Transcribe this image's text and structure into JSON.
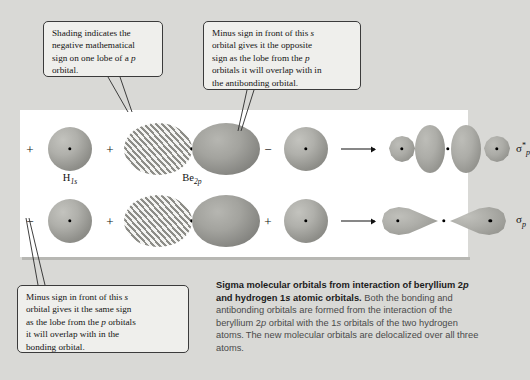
{
  "figure": {
    "background_color": "#d9d9d6",
    "panel_color": "#ffffff"
  },
  "callouts": [
    {
      "id": "shading",
      "name": "callout-shading",
      "text": "Shading indicates the negative mathematical sign on one lobe of a p orbital.",
      "lines": [
        "Shading indicates the",
        "negative mathematical",
        "sign on one lobe of a p",
        "orbital."
      ]
    },
    {
      "id": "antibonding",
      "name": "callout-antibonding",
      "text": "Minus sign in front of this s orbital gives it the opposite sign as the lobe from the p orbitals it will overlap with in the antibonding orbital.",
      "lines": [
        "Minus sign in front of this s",
        "orbital gives it the opposite",
        "sign as the lobe from the p",
        "orbitals it will overlap with in",
        "the antibonding orbital."
      ]
    },
    {
      "id": "bonding",
      "name": "callout-bonding",
      "text": "Minus sign in front of this s orbital gives it the same sign as the lobe from the p orbitals it will overlap with in the bonding orbital.",
      "lines": [
        "Minus sign in front of this s",
        "orbital gives it the same sign",
        "as the lobe from the p orbitals",
        "it will overlap with in the",
        "bonding orbital."
      ]
    }
  ],
  "diagram": {
    "rows": [
      {
        "id": "antibonding",
        "name": "antibonding-row",
        "signs": [
          "+",
          "+",
          "−"
        ],
        "atom_labels": [
          {
            "element": "H",
            "subscript": "1s"
          },
          {
            "element": "Be",
            "subscript": "2p"
          }
        ],
        "result_label": {
          "symbol": "σ",
          "superscript": "*",
          "subscript": "p"
        },
        "result_label_text": "σ*p"
      },
      {
        "id": "bonding",
        "name": "bonding-row",
        "signs": [
          "−",
          "+",
          "+"
        ],
        "result_label": {
          "symbol": "σ",
          "superscript": "",
          "subscript": "p"
        },
        "result_label_text": "σp"
      }
    ]
  },
  "caption": {
    "title": "Sigma molecular orbitals from interaction of beryllium 2p and hydrogen 1s atomic orbitals.",
    "title_part1": "Sigma molecular orbitals from interaction of beryllium",
    "title_part2_a": "2",
    "title_part2_b": "p",
    "title_part2_c": " and hydrogen 1",
    "title_part2_d": "s",
    "title_part2_e": " atomic orbitals.",
    "body": "Both the bonding and antibonding orbitals are formed from the interaction of the beryllium 2p orbital with the 1s orbitals of the two hydrogen atoms. The new molecular orbitals are delocalized over all three atoms.",
    "body_seg1": " Both the bonding and antibonding orbitals are formed from the interaction of the beryllium 2",
    "body_seg2": "p",
    "body_seg3": " orbital with the 1",
    "body_seg4": "s",
    "body_seg5": " orbitals of the two hydrogen atoms. The new molecular orbitals are delocalized over all three atoms."
  }
}
